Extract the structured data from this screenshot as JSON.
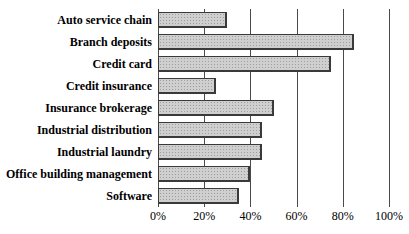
{
  "chart_data": {
    "type": "bar",
    "orientation": "horizontal",
    "title": "",
    "xlabel": "",
    "ylabel": "",
    "categories": [
      "Auto service chain",
      "Branch deposits",
      "Credit card",
      "Credit insurance",
      "Insurance brokerage",
      "Industrial distribution",
      "Industrial laundry",
      "Office building management",
      "Software"
    ],
    "values": [
      30,
      85,
      75,
      25,
      50,
      45,
      45,
      40,
      35
    ],
    "xlim": [
      0,
      100
    ],
    "x_tick_values": [
      0,
      20,
      40,
      60,
      80,
      100
    ],
    "x_tick_labels": [
      "0%",
      "20%",
      "40%",
      "60%",
      "80%",
      "100%"
    ],
    "grid": "vertical-gridlines-on",
    "legend": "none",
    "colors": {
      "bar_fill": "#cfcfcf",
      "bar_dot_texture": "#9e9e9e",
      "bar_border": "#3a3a3a",
      "gridline": "#4a4a4a",
      "text": "#000000",
      "background": "#ffffff"
    }
  }
}
